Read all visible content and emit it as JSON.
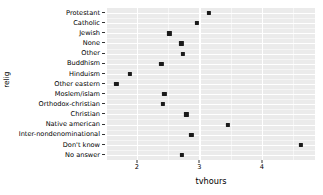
{
  "chart_data": {
    "type": "scatter",
    "title": "",
    "xlabel": "tvhours",
    "ylabel": "relig",
    "xlim": [
      1.52,
      4.85
    ],
    "ylim": [
      0,
      16
    ],
    "grid": true,
    "legend": null,
    "x_ticks": [
      "2",
      "3",
      "4"
    ],
    "x_tick_values": [
      2,
      3,
      4
    ],
    "x_minor_ticks": [
      1.5,
      2.5,
      3.5,
      4.5
    ],
    "categories": [
      "Protestant",
      "Catholic",
      "Jewish",
      "None",
      "Other",
      "Buddhism",
      "Hinduism",
      "Other eastern",
      "Moslem/islam",
      "Orthodox-christian",
      "Christian",
      "Native american",
      "Inter-nondenominational",
      "Don't know",
      "No answer"
    ],
    "values": [
      3.15,
      2.96,
      2.52,
      2.71,
      2.73,
      2.39,
      1.89,
      1.67,
      2.44,
      2.42,
      2.79,
      3.46,
      2.87,
      4.62,
      2.72
    ],
    "point_color": "#1a1a1a",
    "panel_color": "#EBEBEB",
    "gridline_color": "#FFFFFF",
    "background_color": "#FFFFFF"
  }
}
